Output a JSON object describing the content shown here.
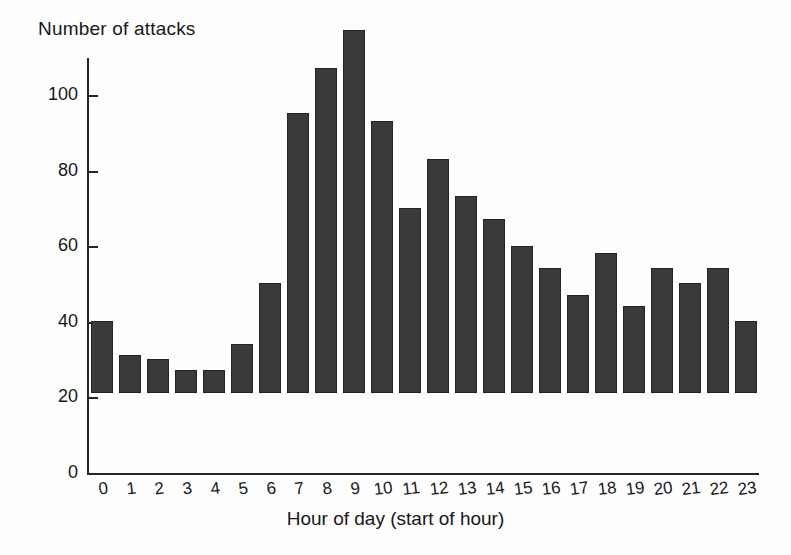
{
  "chart_data": {
    "type": "bar",
    "title": "",
    "ylabel": "Number of attacks",
    "xlabel": "Hour of day (start of hour)",
    "categories": [
      "0",
      "1",
      "2",
      "3",
      "4",
      "5",
      "6",
      "7",
      "8",
      "9",
      "10",
      "11",
      "12",
      "13",
      "14",
      "15",
      "16",
      "17",
      "18",
      "19",
      "20",
      "21",
      "22",
      "23"
    ],
    "values": [
      19,
      10,
      9,
      6,
      6,
      13,
      29,
      74,
      86,
      96,
      72,
      49,
      62,
      52,
      46,
      39,
      33,
      26,
      37,
      23,
      33,
      29,
      33,
      19
    ],
    "ylim": [
      0,
      110
    ],
    "yticks": [
      0,
      20,
      40,
      60,
      80,
      100
    ],
    "ytick_labels": [
      "0",
      "20",
      "40",
      "60",
      "80",
      "100"
    ],
    "grid": false,
    "legend": false,
    "bar_color": "#3a3a3c",
    "axis_color": "#262628",
    "background_color": "#ffffff"
  }
}
